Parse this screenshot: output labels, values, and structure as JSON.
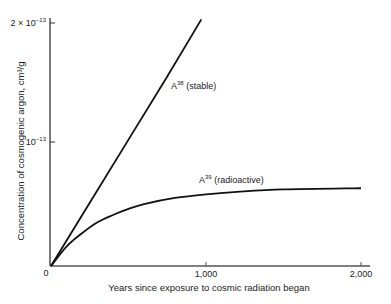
{
  "chart_data": {
    "type": "line",
    "title": "",
    "xlabel": "Years since exposure to cosmic radiation began",
    "ylabel": "Concentration of cosmogenic argon, cm³/g",
    "xlim": [
      0,
      2000
    ],
    "ylim": [
      0,
      2e-13
    ],
    "grid": false,
    "legend": "inline labels",
    "x_ticks": [
      {
        "value": 0,
        "label": "0"
      },
      {
        "value": 1000,
        "label": "1,000"
      },
      {
        "value": 2000,
        "label": "2,000"
      }
    ],
    "y_ticks": [
      {
        "value": 1e-13,
        "label_base": "10",
        "label_exp": "−13"
      },
      {
        "value": 2e-13,
        "label_base": "2 × 10",
        "label_exp": "−13"
      }
    ],
    "series": [
      {
        "name": "A38 (stable)",
        "label_base": "A",
        "label_sup": "38",
        "label_rest": " (stable)",
        "shape": "linear",
        "x": [
          0,
          250,
          500,
          750,
          970
        ],
        "values": [
          0,
          5.2e-14,
          1.04e-13,
          1.56e-13,
          2.03e-13
        ]
      },
      {
        "name": "A39 (radioactive)",
        "label_base": "A",
        "label_sup": "39",
        "label_rest": " (radioactive)",
        "shape": "saturating",
        "x": [
          0,
          100,
          200,
          300,
          400,
          500,
          600,
          800,
          1000,
          1200,
          1500,
          2000
        ],
        "values": [
          0,
          1.6e-14,
          2.7e-14,
          3.6e-14,
          4.2e-14,
          4.7e-14,
          5.1e-14,
          5.6e-14,
          5.9e-14,
          6.1e-14,
          6.3e-14,
          6.4e-14
        ]
      }
    ]
  }
}
